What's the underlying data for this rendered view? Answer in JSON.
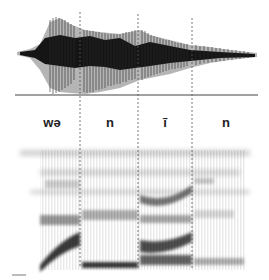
{
  "figure": {
    "type": "waveform-and-spectrogram",
    "segments": [
      {
        "label": "wə",
        "x_center": 52
      },
      {
        "label": "n",
        "x_center": 110
      },
      {
        "label": "ĩ",
        "x_center": 165
      },
      {
        "label": "n",
        "x_center": 226
      }
    ],
    "boundaries_x": [
      80,
      138,
      192
    ],
    "colors": {
      "ink": "#1a1a1a",
      "gray": "#9a9a9a",
      "dashed": "#555555"
    }
  }
}
